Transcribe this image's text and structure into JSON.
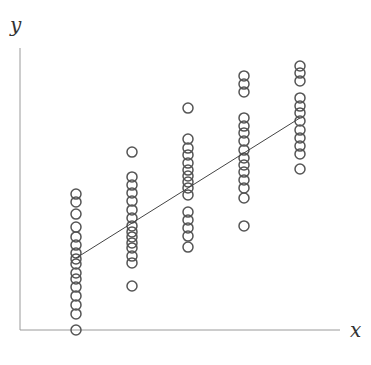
{
  "chart_data": {
    "type": "scatter",
    "title": "",
    "xlabel": "x",
    "ylabel": "y",
    "grid": false,
    "legend": null,
    "xlim": [
      0,
      6
    ],
    "ylim": [
      0,
      100
    ],
    "x_ticks": [],
    "y_ticks": [],
    "colors": {
      "axis": "#9a9a9a",
      "marker_stroke": "#555555",
      "line": "#444444",
      "label": "#333333"
    },
    "marker": "open-circle",
    "series": [
      {
        "name": "observations",
        "points": [
          {
            "x": 1,
            "y": 48.2
          },
          {
            "x": 1,
            "y": 45.4
          },
          {
            "x": 1,
            "y": 41.1
          },
          {
            "x": 1,
            "y": 36.5
          },
          {
            "x": 1,
            "y": 33.0
          },
          {
            "x": 1,
            "y": 30.1
          },
          {
            "x": 1,
            "y": 27.3
          },
          {
            "x": 1,
            "y": 25.2
          },
          {
            "x": 1,
            "y": 23.4
          },
          {
            "x": 1,
            "y": 20.2
          },
          {
            "x": 1,
            "y": 18.1
          },
          {
            "x": 1,
            "y": 15.2
          },
          {
            "x": 1,
            "y": 12.1
          },
          {
            "x": 1,
            "y": 8.9
          },
          {
            "x": 1,
            "y": 5.7
          },
          {
            "x": 1,
            "y": 0.0
          },
          {
            "x": 2,
            "y": 63.1
          },
          {
            "x": 2,
            "y": 54.3
          },
          {
            "x": 2,
            "y": 51.4
          },
          {
            "x": 2,
            "y": 48.6
          },
          {
            "x": 2,
            "y": 45.7
          },
          {
            "x": 2,
            "y": 42.6
          },
          {
            "x": 2,
            "y": 39.7
          },
          {
            "x": 2,
            "y": 36.9
          },
          {
            "x": 2,
            "y": 34.8
          },
          {
            "x": 2,
            "y": 33.0
          },
          {
            "x": 2,
            "y": 30.9
          },
          {
            "x": 2,
            "y": 29.1
          },
          {
            "x": 2,
            "y": 26.2
          },
          {
            "x": 2,
            "y": 23.8
          },
          {
            "x": 2,
            "y": 15.6
          },
          {
            "x": 3,
            "y": 78.7
          },
          {
            "x": 3,
            "y": 67.7
          },
          {
            "x": 3,
            "y": 64.5
          },
          {
            "x": 3,
            "y": 62.1
          },
          {
            "x": 3,
            "y": 59.2
          },
          {
            "x": 3,
            "y": 56.7
          },
          {
            "x": 3,
            "y": 54.6
          },
          {
            "x": 3,
            "y": 52.5
          },
          {
            "x": 3,
            "y": 50.4
          },
          {
            "x": 3,
            "y": 47.9
          },
          {
            "x": 3,
            "y": 41.8
          },
          {
            "x": 3,
            "y": 39.0
          },
          {
            "x": 3,
            "y": 36.2
          },
          {
            "x": 3,
            "y": 33.3
          },
          {
            "x": 3,
            "y": 29.4
          },
          {
            "x": 4,
            "y": 90.1
          },
          {
            "x": 4,
            "y": 87.2
          },
          {
            "x": 4,
            "y": 84.4
          },
          {
            "x": 4,
            "y": 75.2
          },
          {
            "x": 4,
            "y": 72.3
          },
          {
            "x": 4,
            "y": 69.9
          },
          {
            "x": 4,
            "y": 67.0
          },
          {
            "x": 4,
            "y": 63.8
          },
          {
            "x": 4,
            "y": 61.0
          },
          {
            "x": 4,
            "y": 58.5
          },
          {
            "x": 4,
            "y": 56.0
          },
          {
            "x": 4,
            "y": 53.2
          },
          {
            "x": 4,
            "y": 50.4
          },
          {
            "x": 4,
            "y": 46.8
          },
          {
            "x": 4,
            "y": 36.9
          },
          {
            "x": 5,
            "y": 93.6
          },
          {
            "x": 5,
            "y": 91.1
          },
          {
            "x": 5,
            "y": 88.3
          },
          {
            "x": 5,
            "y": 82.3
          },
          {
            "x": 5,
            "y": 79.4
          },
          {
            "x": 5,
            "y": 77.0
          },
          {
            "x": 5,
            "y": 74.1
          },
          {
            "x": 5,
            "y": 70.9
          },
          {
            "x": 5,
            "y": 68.1
          },
          {
            "x": 5,
            "y": 65.2
          },
          {
            "x": 5,
            "y": 62.4
          },
          {
            "x": 5,
            "y": 57.1
          }
        ]
      }
    ],
    "fit_line": {
      "name": "linear fit",
      "x": [
        1,
        5
      ],
      "y": [
        25.5,
        75.2
      ]
    },
    "annotations": []
  }
}
